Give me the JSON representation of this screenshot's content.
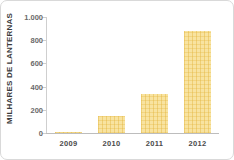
{
  "chart_data": {
    "type": "bar",
    "title": "",
    "xlabel": "",
    "ylabel": "MILHARES DE LANTERNAS",
    "categories": [
      "2009",
      "2010",
      "2011",
      "2012"
    ],
    "values": [
      8,
      150,
      340,
      880
    ],
    "ylim": [
      0,
      1000
    ],
    "yticks": [
      0,
      200,
      400,
      600,
      800,
      1000
    ],
    "ytick_labels": [
      "0",
      "200",
      "400",
      "600",
      "800",
      "1.000"
    ],
    "grid": false,
    "legend": null,
    "series": [
      {
        "name": "MILHARES DE LANTERNAS",
        "values": [
          8,
          150,
          340,
          880
        ],
        "color": "#F8E3A0"
      }
    ],
    "colors": {
      "bar_fill": "#F8E3A0",
      "bar_hatch": "#E2B238",
      "axis": "#BDBDBD",
      "tick_label": "#6A6A6A",
      "category_label": "#4A4A4A",
      "axis_title": "#3A3A3A",
      "card_border": "#D9D9D9",
      "background": "#FFFFFF"
    }
  }
}
